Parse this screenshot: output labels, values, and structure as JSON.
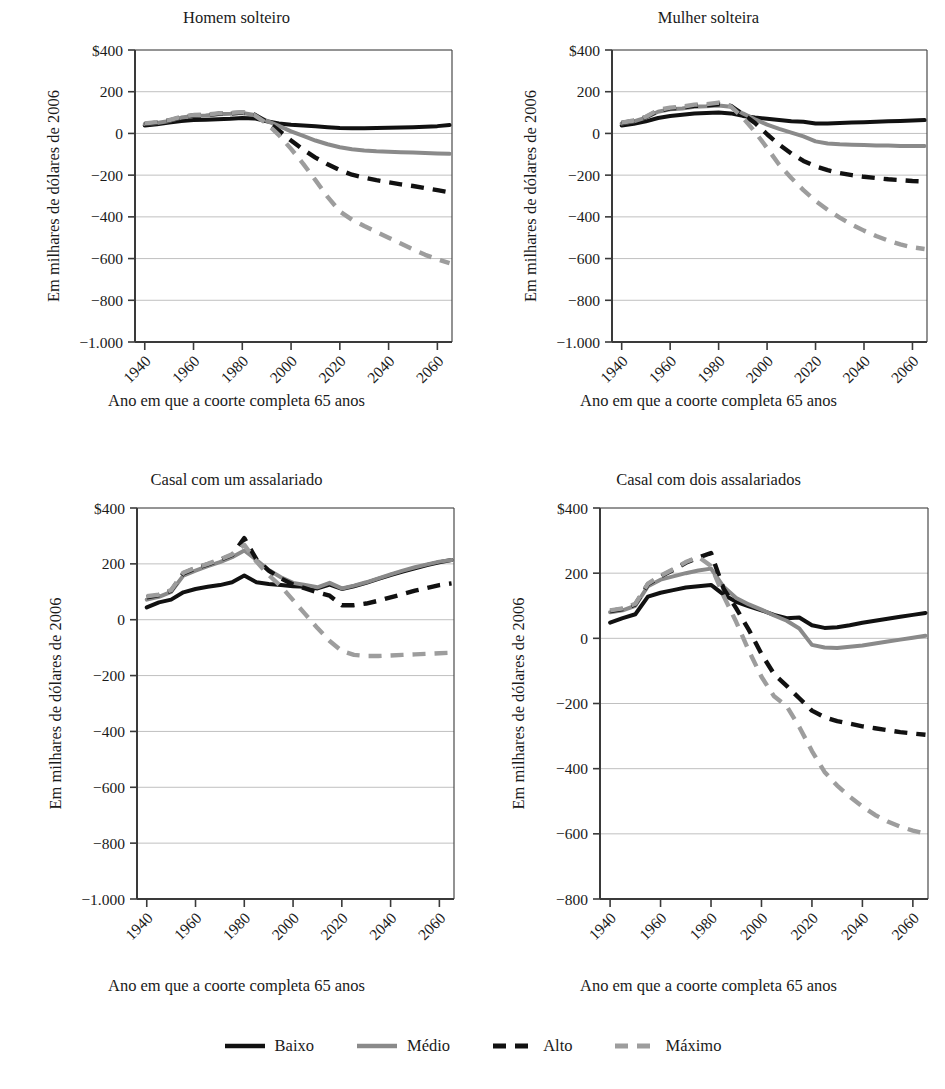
{
  "figure": {
    "background_color": "#ffffff",
    "axis_color": "#4a4a4a",
    "grid_color": "#b9b9b9",
    "text_color": "#1a1a1a"
  },
  "series_styles": [
    {
      "key": "baixo",
      "label": "Baixo",
      "color": "#111111",
      "dash": "none",
      "width": 4.0
    },
    {
      "key": "medio",
      "label": "Médio",
      "color": "#8a8a8a",
      "dash": "none",
      "width": 4.0
    },
    {
      "key": "alto",
      "label": "Alto",
      "color": "#111111",
      "dash": "dashed",
      "width": 4.4
    },
    {
      "key": "maximo",
      "label": "Máximo",
      "color": "#9d9d9d",
      "dash": "dashed",
      "width": 4.4
    }
  ],
  "legend": {
    "items": [
      "Baixo",
      "Médio",
      "Alto",
      "Máximo"
    ]
  },
  "common": {
    "ylabel": "Em milhares de dólares de 2006",
    "xlabel": "Ano em que a coorte completa 65 anos",
    "xticks": [
      "1940",
      "1960",
      "1980",
      "2000",
      "2020",
      "2040",
      "2060"
    ],
    "xlim": [
      1936,
      2066
    ]
  },
  "chart_data": [
    {
      "id": "homem-solteiro",
      "type": "line",
      "title": "Homem solteiro",
      "xlabel": "Ano em que a coorte completa 65 anos",
      "ylabel": "Em milhares de dólares de 2006",
      "xlim": [
        1936,
        2066
      ],
      "ylim": [
        -1000,
        400
      ],
      "yticks": [
        400,
        200,
        0,
        -200,
        -400,
        -600,
        -800,
        -1000
      ],
      "ytick_labels": [
        "$400",
        "200",
        "0",
        "−200",
        "−400",
        "−600",
        "−800",
        "−1.000"
      ],
      "xticks": [
        1940,
        1960,
        1980,
        2000,
        2020,
        2040,
        2060
      ],
      "xtick_labels": [
        "1940",
        "1960",
        "1980",
        "2000",
        "2020",
        "2040",
        "2060"
      ],
      "grid": true,
      "legend_position": "figure-bottom",
      "x": [
        1940,
        1945,
        1950,
        1955,
        1960,
        1965,
        1970,
        1975,
        1980,
        1985,
        1990,
        1995,
        2000,
        2005,
        2010,
        2015,
        2020,
        2025,
        2030,
        2035,
        2040,
        2045,
        2050,
        2055,
        2060,
        2065
      ],
      "series": [
        {
          "name": "Baixo",
          "values": [
            38,
            44,
            52,
            60,
            64,
            66,
            68,
            70,
            74,
            72,
            58,
            48,
            42,
            38,
            34,
            30,
            26,
            25,
            25,
            26,
            27,
            28,
            30,
            32,
            35,
            40
          ]
        },
        {
          "name": "Médio",
          "values": [
            45,
            50,
            60,
            76,
            84,
            86,
            92,
            94,
            98,
            88,
            60,
            36,
            10,
            -12,
            -34,
            -52,
            -66,
            -76,
            -82,
            -86,
            -88,
            -90,
            -92,
            -94,
            -96,
            -98
          ]
        },
        {
          "name": "Alto",
          "values": [
            46,
            52,
            62,
            78,
            86,
            88,
            94,
            96,
            100,
            90,
            56,
            14,
            -34,
            -78,
            -116,
            -148,
            -176,
            -198,
            -212,
            -224,
            -234,
            -244,
            -252,
            -262,
            -272,
            -282
          ]
        },
        {
          "name": "Máximo",
          "values": [
            48,
            54,
            64,
            80,
            88,
            90,
            96,
            98,
            102,
            88,
            48,
            -8,
            -74,
            -146,
            -224,
            -304,
            -374,
            -414,
            -444,
            -472,
            -500,
            -528,
            -556,
            -582,
            -604,
            -622
          ]
        }
      ]
    },
    {
      "id": "mulher-solteira",
      "type": "line",
      "title": "Mulher solteira",
      "xlabel": "Ano em que a coorte completa 65 anos",
      "ylabel": "Em milhares de dólares de 2006",
      "xlim": [
        1936,
        2066
      ],
      "ylim": [
        -1000,
        400
      ],
      "yticks": [
        400,
        200,
        0,
        -200,
        -400,
        -600,
        -800,
        -1000
      ],
      "ytick_labels": [
        "$400",
        "200",
        "0",
        "−200",
        "−400",
        "−600",
        "−800",
        "−1.000"
      ],
      "xticks": [
        1940,
        1960,
        1980,
        2000,
        2020,
        2040,
        2060
      ],
      "xtick_labels": [
        "1940",
        "1960",
        "1980",
        "2000",
        "2020",
        "2040",
        "2060"
      ],
      "grid": true,
      "legend_position": "figure-bottom",
      "x": [
        1940,
        1945,
        1950,
        1955,
        1960,
        1965,
        1970,
        1975,
        1980,
        1985,
        1990,
        1995,
        2000,
        2005,
        2010,
        2015,
        2020,
        2025,
        2030,
        2035,
        2040,
        2045,
        2050,
        2055,
        2060,
        2065
      ],
      "series": [
        {
          "name": "Baixo",
          "values": [
            38,
            46,
            58,
            74,
            84,
            90,
            96,
            98,
            100,
            96,
            84,
            76,
            70,
            64,
            58,
            56,
            48,
            48,
            50,
            52,
            54,
            56,
            58,
            60,
            62,
            64
          ]
        },
        {
          "name": "Médio",
          "values": [
            48,
            58,
            76,
            104,
            116,
            120,
            128,
            130,
            134,
            128,
            96,
            68,
            42,
            22,
            4,
            -14,
            -38,
            -48,
            -52,
            -54,
            -56,
            -58,
            -58,
            -60,
            -60,
            -60
          ]
        },
        {
          "name": "Alto",
          "values": [
            50,
            60,
            78,
            108,
            120,
            124,
            132,
            134,
            140,
            132,
            92,
            50,
            -4,
            -54,
            -96,
            -132,
            -158,
            -176,
            -190,
            -200,
            -208,
            -214,
            -220,
            -224,
            -228,
            -230
          ]
        },
        {
          "name": "Máximo",
          "values": [
            52,
            62,
            80,
            112,
            124,
            128,
            138,
            140,
            148,
            130,
            76,
            8,
            -70,
            -150,
            -214,
            -272,
            -324,
            -366,
            -404,
            -438,
            -466,
            -492,
            -514,
            -532,
            -546,
            -554
          ]
        }
      ]
    },
    {
      "id": "casal-com-um-assalariado",
      "type": "line",
      "title": "Casal com um assalariado",
      "xlabel": "Ano em que a coorte completa 65 anos",
      "ylabel": "Em milhares de dólares de 2006",
      "xlim": [
        1936,
        2066
      ],
      "ylim": [
        -1000,
        400
      ],
      "yticks": [
        400,
        200,
        0,
        -200,
        -400,
        -600,
        -800,
        -1000
      ],
      "ytick_labels": [
        "$400",
        "200",
        "0",
        "−200",
        "−400",
        "−600",
        "−800",
        "−1.000"
      ],
      "xticks": [
        1940,
        1960,
        1980,
        2000,
        2020,
        2040,
        2060
      ],
      "xtick_labels": [
        "1940",
        "1960",
        "1980",
        "2000",
        "2020",
        "2040",
        "2060"
      ],
      "grid": true,
      "legend_position": "figure-bottom",
      "x": [
        1940,
        1945,
        1950,
        1955,
        1960,
        1965,
        1970,
        1975,
        1980,
        1985,
        1990,
        1995,
        2000,
        2005,
        2010,
        2015,
        2020,
        2025,
        2030,
        2035,
        2040,
        2045,
        2050,
        2055,
        2060,
        2065
      ],
      "series": [
        {
          "name": "Baixo",
          "values": [
            44,
            62,
            72,
            98,
            110,
            118,
            124,
            134,
            158,
            134,
            128,
            124,
            120,
            118,
            112,
            126,
            110,
            120,
            132,
            146,
            160,
            172,
            184,
            196,
            206,
            214
          ]
        },
        {
          "name": "Médio",
          "values": [
            72,
            82,
            100,
            158,
            176,
            192,
            206,
            224,
            248,
            214,
            178,
            152,
            132,
            124,
            116,
            132,
            112,
            122,
            134,
            148,
            162,
            176,
            188,
            198,
            208,
            214
          ]
        },
        {
          "name": "Alto",
          "values": [
            80,
            88,
            104,
            166,
            184,
            198,
            214,
            232,
            292,
            216,
            176,
            148,
            126,
            112,
            98,
            86,
            52,
            52,
            58,
            68,
            80,
            92,
            104,
            114,
            124,
            130
          ]
        },
        {
          "name": "Máximo",
          "values": [
            84,
            90,
            106,
            168,
            186,
            200,
            216,
            234,
            268,
            208,
            160,
            120,
            70,
            20,
            -30,
            -76,
            -112,
            -126,
            -130,
            -130,
            -128,
            -126,
            -124,
            -122,
            -120,
            -118
          ]
        }
      ]
    },
    {
      "id": "casal-com-dois-assalariados",
      "type": "line",
      "title": "Casal com dois assalariados",
      "xlabel": "Ano em que a coorte completa 65 anos",
      "ylabel": "Em milhares de dólares de 2006",
      "xlim": [
        1936,
        2066
      ],
      "ylim": [
        -800,
        400
      ],
      "yticks": [
        400,
        200,
        0,
        -200,
        -400,
        -600,
        -800
      ],
      "ytick_labels": [
        "$400",
        "200",
        "0",
        "−200",
        "−400",
        "−600",
        "−800"
      ],
      "xticks": [
        1940,
        1960,
        1980,
        2000,
        2020,
        2040,
        2060
      ],
      "xtick_labels": [
        "1940",
        "1960",
        "1980",
        "2000",
        "2020",
        "2040",
        "2060"
      ],
      "grid": true,
      "legend_position": "figure-bottom",
      "x": [
        1940,
        1945,
        1950,
        1955,
        1960,
        1965,
        1970,
        1975,
        1980,
        1985,
        1990,
        1995,
        2000,
        2005,
        2010,
        2015,
        2020,
        2025,
        2030,
        2035,
        2040,
        2045,
        2050,
        2055,
        2060,
        2065
      ],
      "series": [
        {
          "name": "Baixo",
          "values": [
            48,
            62,
            74,
            128,
            140,
            148,
            156,
            160,
            164,
            134,
            112,
            98,
            86,
            72,
            62,
            64,
            40,
            32,
            34,
            40,
            48,
            54,
            60,
            66,
            72,
            78
          ]
        },
        {
          "name": "Médio",
          "values": [
            80,
            86,
            100,
            160,
            180,
            190,
            200,
            208,
            214,
            158,
            124,
            104,
            88,
            70,
            54,
            30,
            -20,
            -28,
            -30,
            -26,
            -22,
            -16,
            -10,
            -4,
            2,
            8
          ]
        },
        {
          "name": "Alto",
          "values": [
            84,
            90,
            104,
            166,
            190,
            210,
            232,
            248,
            262,
            152,
            92,
            26,
            -48,
            -110,
            -146,
            -184,
            -222,
            -242,
            -254,
            -262,
            -270,
            -276,
            -282,
            -288,
            -292,
            -296
          ]
        },
        {
          "name": "Máximo",
          "values": [
            86,
            92,
            106,
            168,
            192,
            212,
            234,
            250,
            222,
            130,
            50,
            -38,
            -118,
            -178,
            -208,
            -272,
            -346,
            -410,
            -452,
            -486,
            -516,
            -542,
            -562,
            -578,
            -590,
            -600
          ]
        }
      ]
    }
  ]
}
